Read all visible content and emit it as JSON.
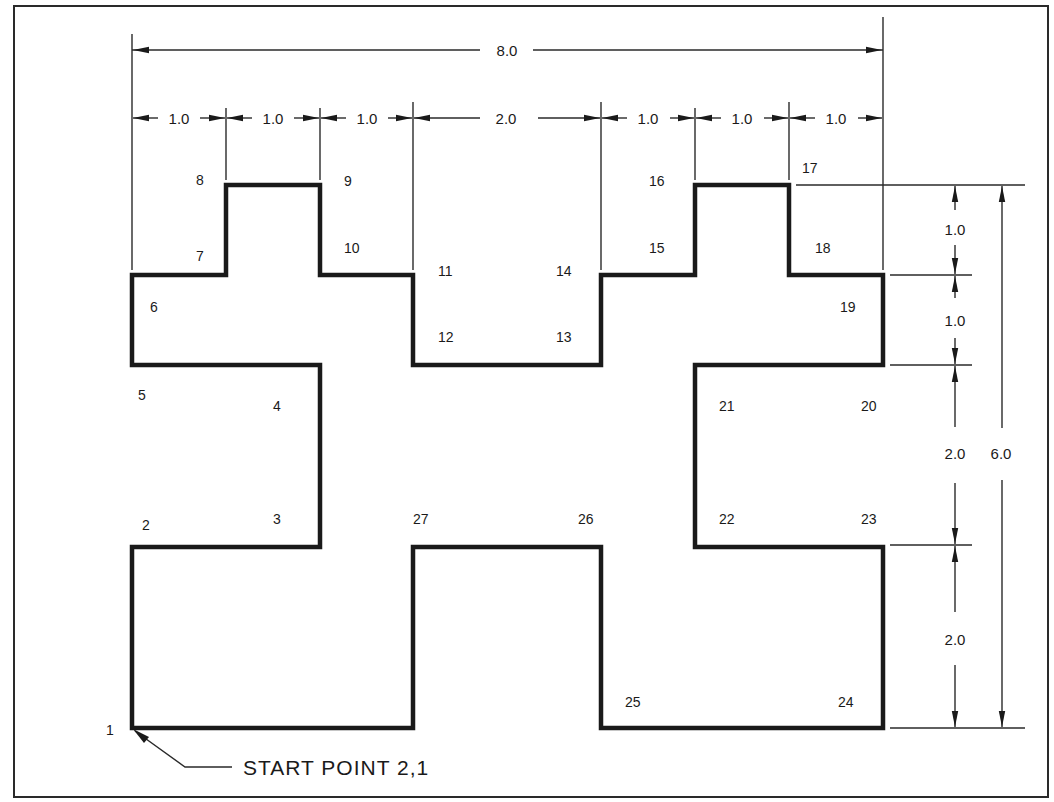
{
  "drawing": {
    "title": "Polyline exercise with dimensions",
    "start_note": "START  POINT  2,1",
    "overall_width": "8.0",
    "overall_height": "6.0",
    "horizontal_dims": [
      "1.0",
      "1.0",
      "1.0",
      "2.0",
      "1.0",
      "1.0",
      "1.0"
    ],
    "vertical_dims": [
      "1.0",
      "1.0",
      "2.0",
      "2.0"
    ],
    "points": [
      {
        "id": "1",
        "u": 0,
        "v": 0
      },
      {
        "id": "2",
        "u": 0,
        "v": 2
      },
      {
        "id": "3",
        "u": 2,
        "v": 2
      },
      {
        "id": "4",
        "u": 2,
        "v": 4
      },
      {
        "id": "5",
        "u": 0,
        "v": 4
      },
      {
        "id": "6",
        "u": 0,
        "v": 5
      },
      {
        "id": "7",
        "u": 1,
        "v": 5
      },
      {
        "id": "8",
        "u": 1,
        "v": 6
      },
      {
        "id": "9",
        "u": 2,
        "v": 6
      },
      {
        "id": "10",
        "u": 2,
        "v": 5
      },
      {
        "id": "11",
        "u": 3,
        "v": 5
      },
      {
        "id": "12",
        "u": 3,
        "v": 4
      },
      {
        "id": "13",
        "u": 5,
        "v": 4
      },
      {
        "id": "14",
        "u": 5,
        "v": 5
      },
      {
        "id": "15",
        "u": 6,
        "v": 5
      },
      {
        "id": "16",
        "u": 6,
        "v": 6
      },
      {
        "id": "17",
        "u": 7,
        "v": 6
      },
      {
        "id": "18",
        "u": 7,
        "v": 5
      },
      {
        "id": "19",
        "u": 8,
        "v": 5
      },
      {
        "id": "20",
        "u": 8,
        "v": 4
      },
      {
        "id": "21",
        "u": 6,
        "v": 4
      },
      {
        "id": "22",
        "u": 6,
        "v": 2
      },
      {
        "id": "23",
        "u": 8,
        "v": 2
      },
      {
        "id": "24",
        "u": 8,
        "v": 0
      },
      {
        "id": "25",
        "u": 5,
        "v": 0
      },
      {
        "id": "26",
        "u": 5,
        "v": 2
      },
      {
        "id": "27",
        "u": 3,
        "v": 2
      }
    ],
    "point_labels": {
      "p1": "1",
      "p2": "2",
      "p3": "3",
      "p4": "4",
      "p5": "5",
      "p6": "6",
      "p7": "7",
      "p8": "8",
      "p9": "9",
      "p10": "10",
      "p11": "11",
      "p12": "12",
      "p13": "13",
      "p14": "14",
      "p15": "15",
      "p16": "16",
      "p17": "17",
      "p18": "18",
      "p19": "19",
      "p20": "20",
      "p21": "21",
      "p22": "22",
      "p23": "23",
      "p24": "24",
      "p25": "25",
      "p26": "26",
      "p27": "27"
    }
  }
}
